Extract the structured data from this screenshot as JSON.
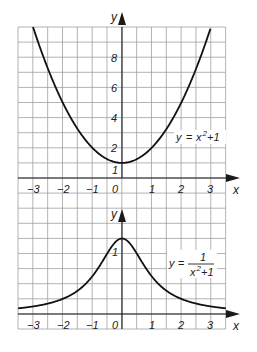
{
  "colors": {
    "grid": "#9a9a9a",
    "axis": "#1a1a1a",
    "curve": "#111111",
    "background": "#ffffff"
  },
  "chart_data": [
    {
      "type": "line",
      "title": "",
      "function_label": "y = x²+1",
      "xlabel": "x",
      "ylabel": "y",
      "xlim": [
        -3.5,
        3.5
      ],
      "ylim": [
        0,
        10
      ],
      "x_ticks": [
        "-3",
        "-2",
        "-1",
        "0",
        "1",
        "2",
        "3"
      ],
      "y_ticks": [
        "1",
        "2",
        "4",
        "6",
        "8"
      ],
      "grid": true,
      "series": [
        {
          "name": "y = x^2 + 1",
          "x": [
            -3,
            -2.5,
            -2,
            -1.5,
            -1,
            -0.5,
            0,
            0.5,
            1,
            1.5,
            2,
            2.5,
            3
          ],
          "values": [
            10,
            7.25,
            5,
            3.25,
            2,
            1.25,
            1,
            1.25,
            2,
            3.25,
            5,
            7.25,
            10
          ]
        }
      ]
    },
    {
      "type": "line",
      "title": "",
      "function_label": "y = 1/(x²+1)",
      "xlabel": "x",
      "ylabel": "y",
      "xlim": [
        -3.5,
        3.5
      ],
      "ylim": [
        0,
        1.3
      ],
      "x_ticks": [
        "-3",
        "-2",
        "-1",
        "0",
        "1",
        "2",
        "3"
      ],
      "y_ticks": [
        "1"
      ],
      "grid": true,
      "series": [
        {
          "name": "y = 1/(x^2 + 1)",
          "x": [
            -3.5,
            -3,
            -2.5,
            -2,
            -1.5,
            -1,
            -0.5,
            0,
            0.5,
            1,
            1.5,
            2,
            2.5,
            3,
            3.5
          ],
          "values": [
            0.075,
            0.1,
            0.138,
            0.2,
            0.308,
            0.5,
            0.8,
            1,
            0.8,
            0.5,
            0.308,
            0.2,
            0.138,
            0.1,
            0.075
          ]
        }
      ]
    }
  ],
  "top": {
    "y_axis_label": "y",
    "x_axis_label": "x",
    "y_tick_labels": {
      "t1": "1",
      "t2": "2",
      "t4": "4",
      "t6": "6",
      "t8": "8"
    },
    "x_tick_labels": {
      "m3": "−3",
      "m2": "−2",
      "m1": "−1",
      "z": "0",
      "p1": "1",
      "p2": "2",
      "p3": "3"
    },
    "fn_y": "y",
    "fn_eq": "=",
    "fn_x": "x",
    "fn_sup": "2",
    "fn_rest": "+1"
  },
  "bottom": {
    "y_axis_label": "y",
    "x_axis_label": "x",
    "y_tick_labels": {
      "t1": "1"
    },
    "x_tick_labels": {
      "m3": "−3",
      "m2": "−2",
      "m1": "−1",
      "z": "0",
      "p1": "1",
      "p2": "2",
      "p3": "3"
    },
    "fn_y": "y",
    "fn_eq": "=",
    "fn_num": "1",
    "fn_den_x": "x",
    "fn_den_sup": "2",
    "fn_den_rest": "+1"
  }
}
